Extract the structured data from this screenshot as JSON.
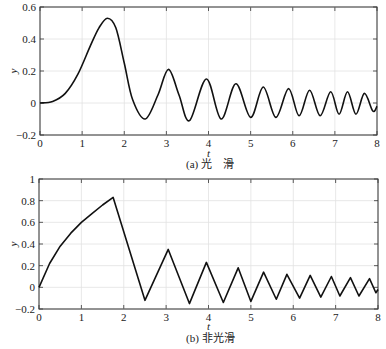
{
  "chart_data": [
    {
      "type": "line",
      "title": "",
      "caption": "(a) 光　滑",
      "xlabel": "t",
      "ylabel": "y",
      "xlim": [
        0,
        8
      ],
      "ylim": [
        -0.2,
        0.6
      ],
      "grid": true,
      "xticks": [
        "0",
        "1",
        "2",
        "3",
        "4",
        "5",
        "6",
        "7",
        "8"
      ],
      "yticks": [
        "−0.2",
        "0",
        "0.2",
        "0.4",
        "0.6"
      ],
      "series": [
        {
          "name": "smooth",
          "x": [
            0,
            0.3,
            0.6,
            0.9,
            1.2,
            1.4,
            1.6,
            1.8,
            2.0,
            2.2,
            2.5,
            2.8,
            3.05,
            3.3,
            3.55,
            3.95,
            4.3,
            4.65,
            5.0,
            5.3,
            5.6,
            5.9,
            6.15,
            6.4,
            6.65,
            6.9,
            7.1,
            7.3,
            7.5,
            7.7,
            7.9,
            8.0
          ],
          "y": [
            0,
            0.01,
            0.06,
            0.18,
            0.36,
            0.47,
            0.53,
            0.47,
            0.25,
            0.02,
            -0.1,
            0.05,
            0.21,
            0.05,
            -0.11,
            0.15,
            -0.1,
            0.12,
            -0.09,
            0.1,
            -0.09,
            0.09,
            -0.08,
            0.08,
            -0.08,
            0.07,
            -0.07,
            0.07,
            -0.07,
            0.06,
            -0.05,
            -0.02
          ]
        }
      ]
    },
    {
      "type": "line",
      "title": "",
      "caption": "(b) 非光滑",
      "xlabel": "t",
      "ylabel": "y",
      "xlim": [
        0,
        8
      ],
      "ylim": [
        -0.2,
        1
      ],
      "grid": true,
      "xticks": [
        "0",
        "1",
        "2",
        "3",
        "4",
        "5",
        "6",
        "7",
        "8"
      ],
      "yticks": [
        "−0.2",
        "0",
        "0.2",
        "0.4",
        "0.6",
        "0.8",
        "1"
      ],
      "series": [
        {
          "name": "non-smooth",
          "x": [
            0,
            0.25,
            0.5,
            0.75,
            1.0,
            1.25,
            1.5,
            1.75,
            2.5,
            3.05,
            3.55,
            3.95,
            4.35,
            4.7,
            5.0,
            5.3,
            5.6,
            5.85,
            6.15,
            6.4,
            6.65,
            6.9,
            7.1,
            7.35,
            7.55,
            7.8,
            7.95,
            8.0
          ],
          "y": [
            0,
            0.22,
            0.38,
            0.5,
            0.6,
            0.68,
            0.76,
            0.83,
            -0.12,
            0.35,
            -0.15,
            0.23,
            -0.14,
            0.18,
            -0.13,
            0.14,
            -0.11,
            0.12,
            -0.1,
            0.11,
            -0.09,
            0.1,
            -0.08,
            0.09,
            -0.08,
            0.08,
            -0.05,
            -0.02
          ]
        }
      ]
    }
  ],
  "ui": {
    "captionA": "(a) 光　滑",
    "captionB": "(b) 非光滑",
    "xlabel": "t",
    "ylabel": "y"
  }
}
